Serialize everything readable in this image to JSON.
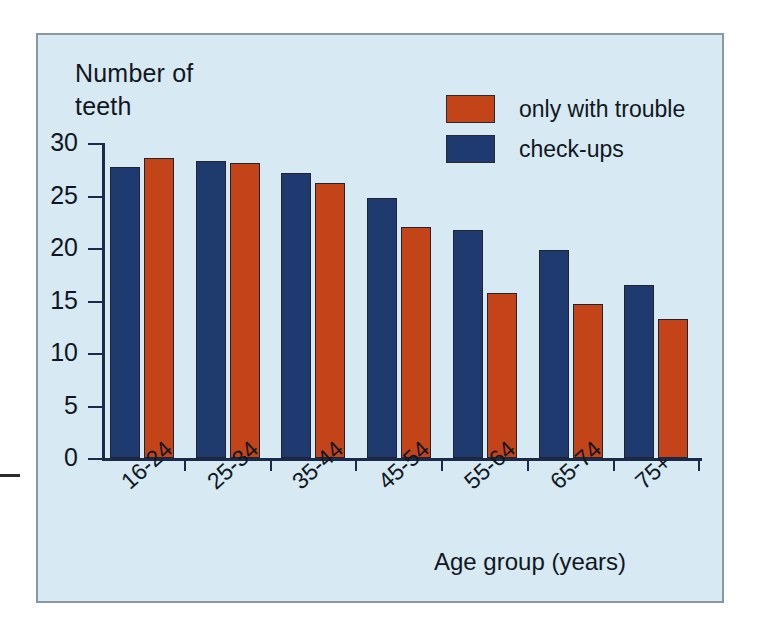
{
  "chart_data": {
    "type": "bar",
    "title": "",
    "ylabel": "Number of teeth",
    "xlabel": "Age group (years)",
    "categories": [
      "16-24",
      "25-34",
      "35-44",
      "45-54",
      "55-64",
      "65-74",
      "75+"
    ],
    "series": [
      {
        "name": "check-ups",
        "color": "#1f3a6e",
        "values": [
          27.7,
          28.3,
          27.1,
          24.8,
          21.7,
          19.8,
          16.5
        ]
      },
      {
        "name": "only with trouble",
        "color": "#c4441a",
        "values": [
          28.6,
          28.1,
          26.2,
          22.0,
          15.7,
          14.7,
          13.2
        ]
      }
    ],
    "series_draw_order": [
      "check-ups",
      "only with trouble"
    ],
    "ylim": [
      0,
      30
    ],
    "yticks": [
      0,
      5,
      10,
      15,
      20,
      25,
      30
    ],
    "ytick_labels": [
      "0",
      "5",
      "10",
      "15",
      "20",
      "25",
      "30"
    ],
    "grid": false,
    "legend_position": "top-right"
  },
  "legend": {
    "items": [
      {
        "label": "only with trouble",
        "color": "#c4441a"
      },
      {
        "label": "check-ups",
        "color": "#1f3a6e"
      }
    ]
  },
  "colors": {
    "background": "#d7e9f2",
    "frame_border": "#8a98a3",
    "axis": "#1b2a4a",
    "text": "#111722",
    "orange": "#c4441a",
    "navy": "#1f3a6e"
  }
}
